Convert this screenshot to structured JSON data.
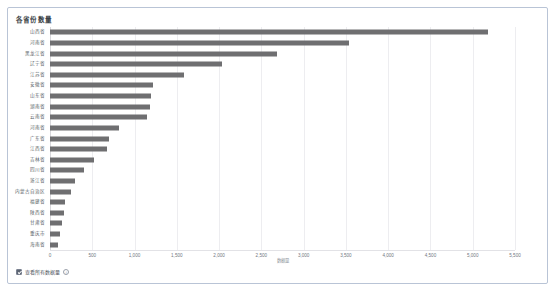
{
  "card": {
    "border_color": "#b9c4d6",
    "background": "#ffffff"
  },
  "chart_title": "各省份数量",
  "footer": {
    "legend_label": "查看所有数据量",
    "info_icon": "info-icon",
    "checkbox_checked": true
  },
  "chart_data": {
    "type": "bar",
    "orientation": "horizontal",
    "title": "各省份数量",
    "xlabel": "数据量",
    "ylabel": "",
    "xlim": [
      0,
      5500
    ],
    "grid": true,
    "legend": "none",
    "bar_color": "#6f6f71",
    "xticks": [
      "0",
      "500",
      "1,000",
      "1,500",
      "2,000",
      "2,500",
      "3,000",
      "3,500",
      "4,000",
      "4,500",
      "5,000",
      "5,500"
    ],
    "xtick_values": [
      0,
      500,
      1000,
      1500,
      2000,
      2500,
      3000,
      3500,
      4000,
      4500,
      5000,
      5500
    ],
    "categories": [
      "山西省",
      "河南省",
      "黑龙江省",
      "辽宁省",
      "江苏省",
      "安徽省",
      "山东省",
      "湖南省",
      "云南省",
      "河南省",
      "广东省",
      "江西省",
      "吉林省",
      "四川省",
      "浙江省",
      "内蒙古自治区",
      "福建省",
      "陕西省",
      "甘肃省",
      "重庆市",
      "海南省"
    ],
    "values": [
      5180,
      3540,
      2680,
      2030,
      1580,
      1220,
      1200,
      1180,
      1150,
      820,
      700,
      680,
      520,
      400,
      300,
      250,
      180,
      160,
      140,
      120,
      100
    ]
  }
}
